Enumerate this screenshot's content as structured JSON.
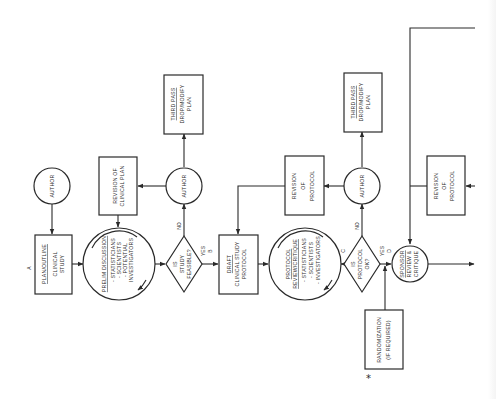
{
  "diagram": {
    "orientation": "text rotated 90 degrees counter-clockwise",
    "line_color": "#2a2a2a",
    "background": "#ffffff"
  },
  "labels": {
    "start_marker": "A",
    "marker_b": "B",
    "marker_c": "C",
    "marker_d": "D",
    "asterisk": "*",
    "no_1": "NO",
    "yes_1": "YES",
    "no_2": "NO",
    "yes_2": "YES"
  },
  "nodes": {
    "author_start": {
      "type": "circle",
      "lines": [
        "AUTHOR"
      ]
    },
    "plan_outline": {
      "type": "box",
      "title": "PLAN/OUTLINE",
      "lines": [
        "CLINICAL",
        "STUDY"
      ]
    },
    "prelim_discussion": {
      "type": "circle",
      "title": "PRELIM DISCUSSION",
      "lines": [
        "- STATISTICIANS",
        "- SCIENTISTS",
        "- POTENTIAL",
        "  INVESTIGATORS"
      ]
    },
    "revision_clinical_plan": {
      "type": "box",
      "lines": [
        "REVISION OF",
        "CLINICAL PLAN"
      ]
    },
    "study_feasible": {
      "type": "diamond",
      "lines": [
        "IS",
        "STUDY",
        "FEASIBLE?"
      ]
    },
    "author_1": {
      "type": "circle",
      "lines": [
        "AUTHOR"
      ]
    },
    "third_pass_1": {
      "type": "box",
      "title": "THIRD PASS",
      "lines": [
        "DROP/MODIFY",
        "PLAN"
      ]
    },
    "draft_protocol": {
      "type": "box",
      "title": "DRAFT",
      "lines": [
        "CLINICAL STUDY",
        "PROTOCOL"
      ]
    },
    "protocol_review": {
      "type": "circle",
      "title_lines": [
        "PROTOCOL",
        "REVIEW/CRITIQUE"
      ],
      "lines": [
        "- STATISTICIANS",
        "- SCIENTISTS",
        "- INVESTIGATORS"
      ]
    },
    "revision_protocol_1": {
      "type": "box",
      "lines": [
        "REVISION",
        "OF",
        "PROTOCOL"
      ]
    },
    "protocol_ok": {
      "type": "diamond",
      "lines": [
        "IS",
        "PROTOCOL",
        "OK?"
      ]
    },
    "author_2": {
      "type": "circle",
      "lines": [
        "AUTHOR"
      ]
    },
    "third_pass_2": {
      "type": "box",
      "title": "THIRD PASS",
      "lines": [
        "DROP/MODIFY",
        "PLAN"
      ]
    },
    "randomization": {
      "type": "box",
      "lines": [
        "RANDOMIZATION",
        "(IF REQUIRED)"
      ]
    },
    "sponsor_review": {
      "type": "circle",
      "lines": [
        "SPONSOR",
        "REVIEW &",
        "CRITIQUE"
      ]
    },
    "revision_protocol_2": {
      "type": "box",
      "lines": [
        "REVISION",
        "OF",
        "PROTOCOL"
      ]
    }
  }
}
